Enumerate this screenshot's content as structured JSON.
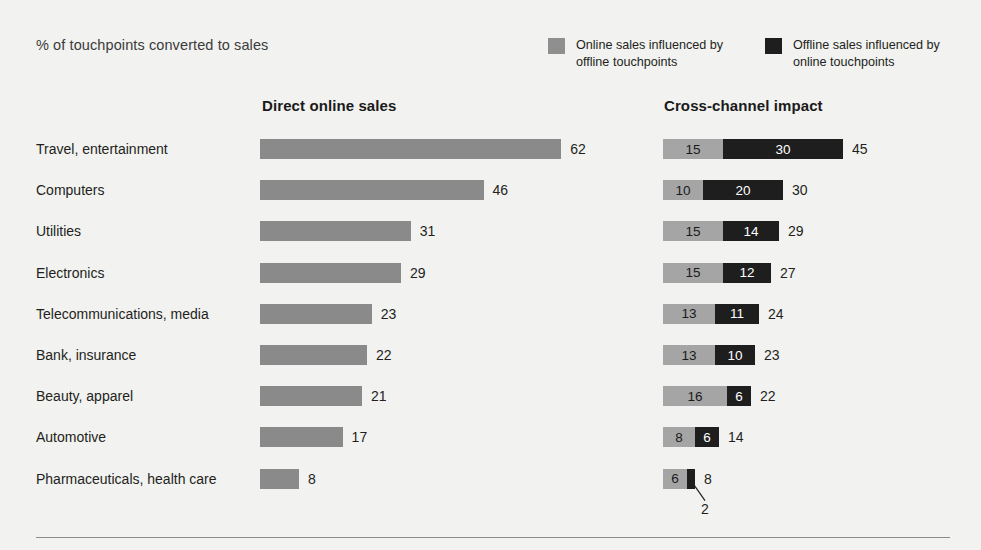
{
  "header": {
    "subtitle": "% of touchpoints converted to sales"
  },
  "legend": {
    "items": [
      {
        "label": "Online sales influenced by offline touchpoints",
        "color": "#8f8f8f",
        "key": "online"
      },
      {
        "label": "Offline sales influenced by online touchpoints",
        "color": "#1e1e1e",
        "key": "offline"
      }
    ]
  },
  "panels": {
    "left_heading": "Direct online sales",
    "right_heading": "Cross-channel impact"
  },
  "colors": {
    "background": "#f2f2f0",
    "left_bar": "#8a8a8a",
    "online_segment": "#a5a5a5",
    "offline_segment": "#1e1e1e",
    "text": "#231f20",
    "rule": "#8c8c8c"
  },
  "callout": {
    "value": "2"
  },
  "chart_data": {
    "type": "bar",
    "title": "% of touchpoints converted to sales",
    "subtitle": "% of touchpoints converted to sales",
    "orientation": "horizontal",
    "xlabel": "",
    "ylabel": "",
    "grid": false,
    "legend_position": "top-right",
    "categories": [
      "Travel, entertainment",
      "Computers",
      "Utilities",
      "Electronics",
      "Telecommunications, media",
      "Bank, insurance",
      "Beauty, apparel",
      "Automotive",
      "Pharmaceuticals, health care"
    ],
    "panels": [
      {
        "name": "Direct online sales",
        "stacked": false,
        "series": [
          {
            "name": "Direct online sales",
            "values": [
              62,
              46,
              31,
              29,
              23,
              22,
              21,
              17,
              8
            ]
          }
        ]
      },
      {
        "name": "Cross-channel impact",
        "stacked": true,
        "series": [
          {
            "name": "Online sales influenced by offline touchpoints",
            "values": [
              15,
              10,
              15,
              15,
              13,
              13,
              16,
              8,
              6
            ]
          },
          {
            "name": "Offline sales influenced by online touchpoints",
            "values": [
              30,
              20,
              14,
              12,
              11,
              10,
              6,
              6,
              2
            ]
          }
        ],
        "totals": [
          45,
          30,
          29,
          27,
          24,
          23,
          22,
          14,
          8
        ]
      }
    ],
    "rows": [
      {
        "category": "Travel, entertainment",
        "direct": 62,
        "online": 15,
        "offline": 30,
        "total": 45
      },
      {
        "category": "Computers",
        "direct": 46,
        "online": 10,
        "offline": 20,
        "total": 30
      },
      {
        "category": "Utilities",
        "direct": 31,
        "online": 15,
        "offline": 14,
        "total": 29
      },
      {
        "category": "Electronics",
        "direct": 29,
        "online": 15,
        "offline": 12,
        "total": 27
      },
      {
        "category": "Telecommunications, media",
        "direct": 23,
        "online": 13,
        "offline": 11,
        "total": 24
      },
      {
        "category": "Bank, insurance",
        "direct": 22,
        "online": 13,
        "offline": 10,
        "total": 23
      },
      {
        "category": "Beauty, apparel",
        "direct": 21,
        "online": 16,
        "offline": 6,
        "total": 22
      },
      {
        "category": "Automotive",
        "direct": 17,
        "online": 8,
        "offline": 6,
        "total": 14
      },
      {
        "category": "Pharmaceuticals, health care",
        "direct": 8,
        "online": 6,
        "offline": 2,
        "total": 8
      }
    ]
  }
}
